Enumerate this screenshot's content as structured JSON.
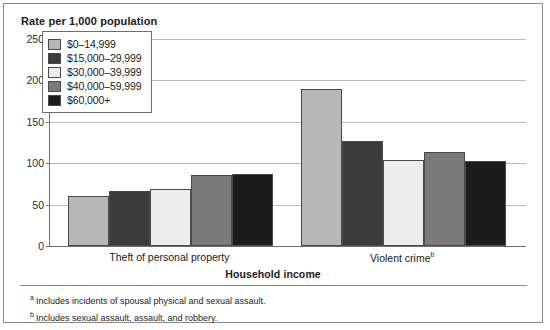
{
  "figure": {
    "title": "Rate per 1,000 population",
    "xaxis_title": "Household income"
  },
  "footnotes": [
    {
      "marker": "a",
      "text": "Includes incidents of spousal physical and sexual assault."
    },
    {
      "marker": "b",
      "text": "Includes sexual assault, assault, and robbery."
    }
  ],
  "chart_data": {
    "type": "bar",
    "title": "Rate per 1,000 population",
    "xlabel": "Household income",
    "ylabel": "Rate per 1,000 population",
    "ylim": [
      0,
      250
    ],
    "yticks": [
      0,
      50,
      100,
      150,
      200,
      250
    ],
    "grid": true,
    "legend_position": "inside-top-left",
    "categories": [
      "Theft of personal property",
      "Violent crime"
    ],
    "category_markers": [
      "",
      "b"
    ],
    "series": [
      {
        "name": "$0–14,999",
        "color": "#b7b7b7",
        "values": [
          61,
          190
        ]
      },
      {
        "name": "$15,000–29,999",
        "color": "#3b3b3b",
        "values": [
          67,
          127
        ]
      },
      {
        "name": "$30,000–39,999",
        "color": "#ededed",
        "values": [
          69,
          104
        ]
      },
      {
        "name": "$40,000–59,999",
        "color": "#7a7a7a",
        "values": [
          86,
          114
        ]
      },
      {
        "name": "$60,000+",
        "color": "#1c1c1c",
        "values": [
          87,
          103
        ]
      }
    ]
  }
}
